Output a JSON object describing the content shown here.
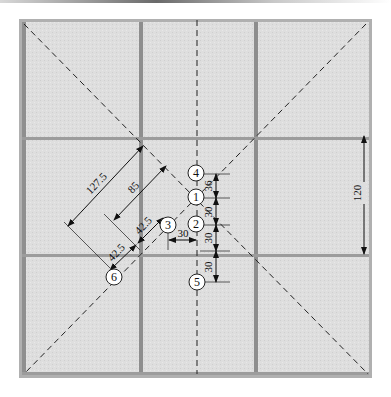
{
  "diagram": {
    "type": "floor-tile-layout",
    "grid": {
      "rows": 3,
      "cols": 3
    },
    "colors": {
      "tile": "#dcdcdc",
      "tile_edge": "#9a9a9a",
      "frame": "#a8a8a8",
      "line": "#222222"
    },
    "points": [
      {
        "id": "1",
        "label": "1"
      },
      {
        "id": "2",
        "label": "2"
      },
      {
        "id": "3",
        "label": "3"
      },
      {
        "id": "4",
        "label": "4"
      },
      {
        "id": "5",
        "label": "5"
      },
      {
        "id": "6",
        "label": "6"
      }
    ],
    "dimensions": {
      "tile_height": "120",
      "vertical_spacing": [
        "36",
        "30",
        "30",
        "30"
      ],
      "horizontal_offset": "30",
      "diagonal_outer": "127.5",
      "diagonal_inner": "85",
      "diagonal_short_a": "42.5",
      "diagonal_short_b": "42.5"
    }
  }
}
